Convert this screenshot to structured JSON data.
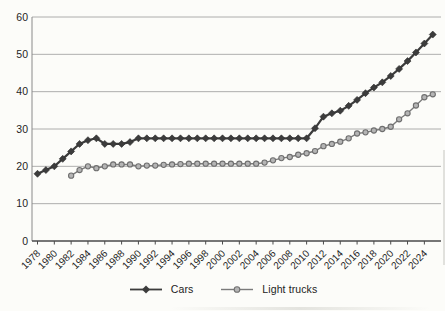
{
  "chart_data": {
    "type": "line",
    "unit_hint": "mpg",
    "ylim": [
      0,
      60
    ],
    "xlim": [
      1978,
      2025
    ],
    "grid": "horizontal",
    "legend_position": "bottom-center",
    "y_ticks": [
      0,
      10,
      20,
      30,
      40,
      50,
      60
    ],
    "x_ticks": [
      1978,
      1980,
      1982,
      1984,
      1986,
      1988,
      1990,
      1992,
      1994,
      1996,
      1998,
      2000,
      2002,
      2004,
      2006,
      2008,
      2010,
      2012,
      2014,
      2016,
      2018,
      2020,
      2022,
      2024
    ],
    "series": [
      {
        "name": "Cars",
        "marker": "diamond",
        "line_color": "#3c3c3c",
        "line_width": 2.2,
        "marker_fill": "#3c3c3c",
        "marker_stroke": "#2e2e2e",
        "start_year": 1978,
        "values": [
          18,
          19,
          20,
          22,
          24,
          26,
          27,
          27.5,
          26,
          26,
          26,
          26.5,
          27.5,
          27.5,
          27.5,
          27.5,
          27.5,
          27.5,
          27.5,
          27.5,
          27.5,
          27.5,
          27.5,
          27.5,
          27.5,
          27.5,
          27.5,
          27.5,
          27.5,
          27.5,
          27.5,
          27.5,
          27.5,
          30.2,
          33.3,
          34.2,
          34.9,
          36.2,
          37.8,
          39.6,
          41.1,
          42.5,
          44.2,
          46.1,
          48.2,
          50.5,
          52.9,
          55.3
        ]
      },
      {
        "name": "Light trucks",
        "marker": "circle",
        "line_color": "#7b7b7b",
        "line_width": 1.4,
        "marker_fill": "#b5b5b5",
        "marker_stroke": "#6f6f6f",
        "start_year": 1982,
        "values": [
          17.5,
          19,
          20,
          19.5,
          20,
          20.5,
          20.5,
          20.5,
          20,
          20.2,
          20.2,
          20.4,
          20.5,
          20.6,
          20.7,
          20.7,
          20.7,
          20.7,
          20.7,
          20.7,
          20.7,
          20.7,
          20.7,
          21,
          21.6,
          22.2,
          22.5,
          23.1,
          23.5,
          24.1,
          25.4,
          26,
          26.6,
          27.5,
          28.8,
          29.1,
          29.6,
          30,
          30.6,
          32.6,
          34.2,
          36.3,
          38.5,
          39.3
        ]
      }
    ]
  },
  "colors": {
    "background": "#fcfcf9",
    "gridline": "#9b9b9b",
    "axis": "#4a4a4a",
    "y_axis": "#8a8a8a",
    "text": "#1f1f1f"
  }
}
